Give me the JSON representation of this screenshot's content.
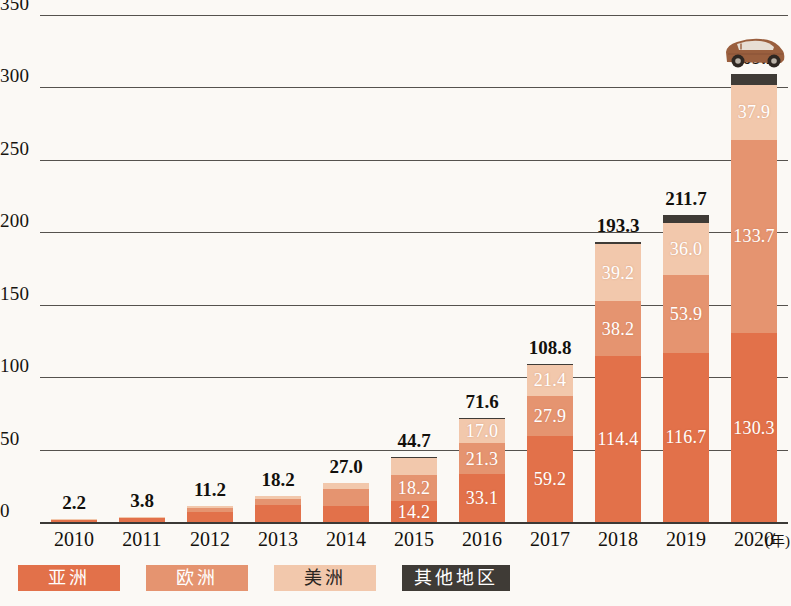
{
  "chart_data": {
    "type": "bar",
    "subtype": "stacked-column",
    "title": "",
    "xlabel": "(年)",
    "ylabel": "",
    "ylim": [
      0,
      350
    ],
    "ytick_step": 50,
    "ytick_labels": [
      "0",
      "50",
      "100",
      "150",
      "200",
      "250",
      "300",
      "350"
    ],
    "grid": true,
    "legend_position": "bottom-left",
    "categories": [
      "2010",
      "2011",
      "2012",
      "2013",
      "2014",
      "2015",
      "2016",
      "2017",
      "2018",
      "2019",
      "2020"
    ],
    "series": [
      {
        "name": "亚洲",
        "color": "#e2714a",
        "values": [
          1.5,
          2.6,
          7.2,
          11.5,
          10.8,
          14.2,
          33.1,
          59.2,
          114.4,
          116.7,
          130.3
        ],
        "labels": [
          "",
          "",
          "",
          "",
          "",
          "14.2",
          "33.1",
          "59.2",
          "114.4",
          "116.7",
          "130.3"
        ]
      },
      {
        "name": "欧洲",
        "color": "#e59470",
        "values": [
          0.5,
          0.8,
          2.6,
          4.3,
          12.0,
          18.2,
          21.3,
          27.9,
          38.2,
          53.9,
          133.7
        ],
        "labels": [
          "",
          "",
          "",
          "",
          "12.0",
          "18.2",
          "21.3",
          "27.9",
          "38.2",
          "53.9",
          "133.7"
        ]
      },
      {
        "name": "美洲",
        "color": "#f2c8ac",
        "values": [
          0.2,
          0.4,
          1.4,
          2.4,
          4.2,
          12.2,
          17.0,
          21.4,
          39.2,
          36.0,
          37.9
        ],
        "labels": [
          "",
          "",
          "",
          "",
          "",
          "12.2",
          "17.0",
          "21.4",
          "39.2",
          "36.0",
          "37.9"
        ]
      },
      {
        "name": "其他地区",
        "color": "#3f3b36",
        "values": [
          0.0,
          0.0,
          0.0,
          0.0,
          0.0,
          0.1,
          0.2,
          0.3,
          1.5,
          5.1,
          7.3
        ],
        "labels": [
          "",
          "",
          "",
          "",
          "",
          "",
          "",
          "",
          "",
          "",
          ""
        ]
      }
    ],
    "totals": [
      2.2,
      3.8,
      11.2,
      18.2,
      27.0,
      44.7,
      71.6,
      108.8,
      193.3,
      211.7,
      309.2
    ],
    "total_labels": [
      "2.2",
      "3.8",
      "11.2",
      "18.2",
      "27.0",
      "44.7",
      "71.6",
      "108.8",
      "193.3",
      "211.7",
      "309.2"
    ]
  },
  "axis": {
    "x_unit": "(年)"
  },
  "legend": {
    "items": [
      {
        "label": "亚洲",
        "color": "#e2714a",
        "text_color": "#ffffff"
      },
      {
        "label": "欧洲",
        "color": "#e59470",
        "text_color": "#ffffff"
      },
      {
        "label": "美洲",
        "color": "#f2c8ac",
        "text_color": "#2a2622"
      },
      {
        "label": "其他地区",
        "color": "#3f3b36",
        "text_color": "#ffffff"
      }
    ]
  },
  "decoration": {
    "car_icon": "car-icon",
    "car_icon_body_color": "#9a5f3e",
    "car_icon_window_color": "#e7ded4"
  },
  "colors": {
    "background": "#fbf9f5",
    "gridline": "#55524e",
    "baseline": "#3b3936",
    "text": "#12100c"
  }
}
